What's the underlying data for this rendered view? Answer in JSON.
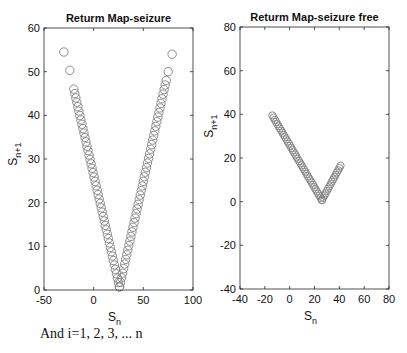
{
  "chart_data": [
    {
      "type": "scatter",
      "title": "Returm Map-seizure",
      "xlabel": "S_n",
      "ylabel": "S_n+1",
      "xlim": [
        -50,
        100
      ],
      "ylim": [
        0,
        60
      ],
      "xticks": [
        -50,
        0,
        50,
        100
      ],
      "yticks": [
        0,
        10,
        20,
        30,
        40,
        50,
        60
      ],
      "grid": false,
      "marker": "open-circle",
      "series": [
        {
          "name": "outliers",
          "points": [
            [
              -30,
              54.5
            ],
            [
              -24,
              50.3
            ],
            [
              75,
              50.0
            ],
            [
              79,
              54.0
            ]
          ]
        },
        {
          "name": "left-arm",
          "from": [
            -20,
            46
          ],
          "to": [
            26,
            0.7
          ],
          "count": 46
        },
        {
          "name": "right-arm",
          "from": [
            26,
            0.7
          ],
          "to": [
            73,
            48
          ],
          "count": 46
        }
      ]
    },
    {
      "type": "scatter",
      "title": "Returm Map-seizure free",
      "xlabel": "S_n",
      "ylabel": "S_n+1",
      "xlim": [
        -40,
        80
      ],
      "ylim": [
        -40,
        80
      ],
      "xticks": [
        -40,
        -20,
        0,
        20,
        40,
        60,
        80
      ],
      "yticks": [
        -40,
        -20,
        0,
        20,
        40,
        60,
        80
      ],
      "grid": false,
      "marker": "open-circle",
      "series": [
        {
          "name": "descending-arm",
          "from": [
            -14,
            39.5
          ],
          "to": [
            26,
            0.7
          ],
          "count": 40
        },
        {
          "name": "ascending-arm",
          "from": [
            26,
            0.7
          ],
          "to": [
            41,
            16.5
          ],
          "count": 16
        }
      ]
    }
  ],
  "caption": "And i=1, 2, 3, ... n",
  "colors": {
    "marker_stroke": "#808080",
    "axes": "#262626",
    "text": "#111111"
  }
}
